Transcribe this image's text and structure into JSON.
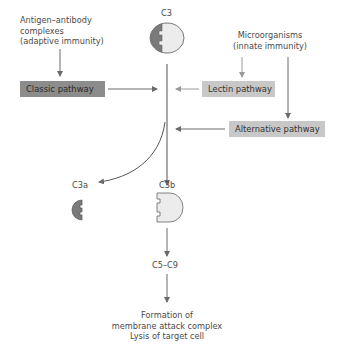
{
  "diagram": {
    "sources": {
      "adaptive": [
        "Antigen–antibody",
        "complexes",
        "(adaptive immunity)"
      ],
      "innate": [
        "Microorganisms",
        "(innate immunity)"
      ]
    },
    "pathways": {
      "classic": "Classic pathway",
      "lectin": "Lectin pathway",
      "alternative": "Alternative pathway"
    },
    "molecules": {
      "c3": "C3",
      "c3a": "C3a",
      "c3b": "C3b",
      "c5_c9": "C5–C9"
    },
    "outcome": [
      "Formation of",
      "membrane attack complex",
      "Lysis of target cell"
    ],
    "colors": {
      "classic_box": "#8c8c8c",
      "lectin_box": "#c8c8c8",
      "alternative_box": "#c8c8c8",
      "c3_dark": "#7a7a7a",
      "c3_light": "#ececec",
      "arrow": "#6a6a6a"
    }
  }
}
